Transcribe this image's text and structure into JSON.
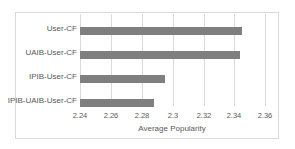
{
  "chart_data": {
    "type": "bar",
    "orientation": "horizontal",
    "title": "",
    "categories": [
      "User-CF",
      "UAIB-User-CF",
      "IPIB-User-CF",
      "IPIB-UAIB-User-CF"
    ],
    "values": [
      2.345,
      2.344,
      2.295,
      2.288
    ],
    "xlabel": "Average Popularity",
    "ylabel": "",
    "xlim": [
      2.24,
      2.36
    ],
    "xticks": [
      "2.24",
      "2.26",
      "2.28",
      "2.3",
      "2.32",
      "2.34",
      "2.36"
    ],
    "grid": true,
    "legend": null,
    "bar_color": "#7f7f7f"
  }
}
